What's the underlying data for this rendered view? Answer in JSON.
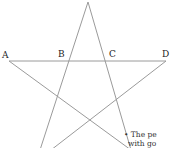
{
  "diagram": {
    "type": "pentagram",
    "line_color": "#9a9a9a",
    "labels": [
      {
        "text": "A",
        "x": 2,
        "y": 51
      },
      {
        "text": "B",
        "x": 58,
        "y": 50
      },
      {
        "text": "C",
        "x": 109,
        "y": 50
      },
      {
        "text": "D",
        "x": 162,
        "y": 50
      }
    ],
    "note": {
      "line1": "• The pe",
      "line2": "with go"
    }
  }
}
